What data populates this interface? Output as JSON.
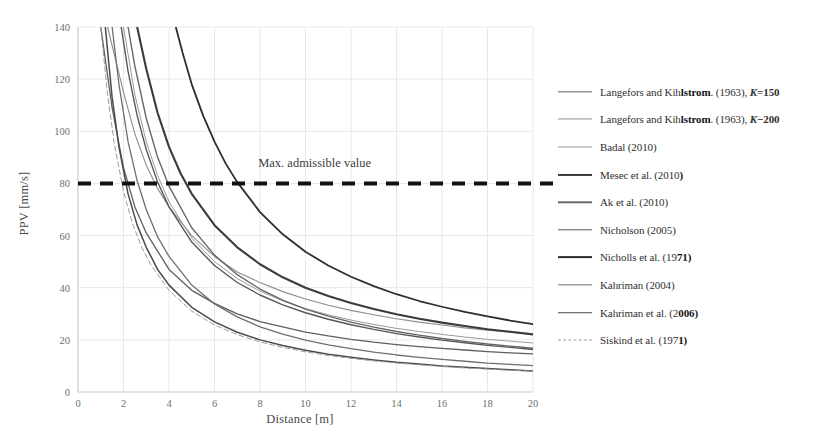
{
  "chart_data": {
    "type": "line",
    "title": "",
    "xlabel": "Distance [m]",
    "ylabel": "PPV [mm/s]",
    "xlim": [
      0,
      20
    ],
    "ylim": [
      0,
      140
    ],
    "xticks": [
      0,
      2,
      4,
      6,
      8,
      10,
      12,
      14,
      16,
      18,
      20
    ],
    "yticks": [
      0,
      20,
      40,
      60,
      80,
      100,
      120,
      140
    ],
    "grid": true,
    "legend_position": "right",
    "annotations": [
      {
        "text": "Max. admissible value",
        "x": 10.4,
        "y": 87,
        "kind": "threshold-label"
      }
    ],
    "threshold": {
      "label": "Max. admissible value",
      "value": 80,
      "style": "dashed",
      "color": "#111111",
      "width": 4
    },
    "series": [
      {
        "name": "Langefors and Kihlstrom. (1963), K=150",
        "color": "#5f5f5f",
        "width": 1.3,
        "dash": "none",
        "x": [
          1.0,
          1.5,
          2.0,
          2.5,
          3.0,
          4.0,
          5.0,
          6.0,
          7.0,
          8.0,
          9.0,
          10.0,
          11.0,
          12.0,
          13.0,
          14.0,
          15.0,
          16.0,
          17.0,
          18.0,
          19.0,
          20.0
        ],
        "y": [
          140.0,
          109.0,
          86.0,
          71.0,
          61.0,
          47.0,
          39.0,
          34.0,
          30.0,
          27.0,
          25.0,
          23.0,
          21.5,
          20.2,
          19.1,
          18.2,
          17.4,
          16.7,
          16.1,
          15.5,
          15.0,
          14.6
        ]
      },
      {
        "name": "Langefors and Kihlstrom. (1963), K=200",
        "color": "#8d8d8d",
        "width": 1.1,
        "dash": "none",
        "x": [
          1.3,
          2.0,
          2.5,
          3.0,
          3.5,
          4.0,
          5.0,
          6.0,
          7.0,
          8.0,
          9.0,
          10.0,
          11.0,
          12.0,
          13.0,
          14.0,
          15.0,
          16.0,
          17.0,
          18.0,
          19.0,
          20.0
        ],
        "y": [
          140.0,
          115.0,
          99.0,
          87.0,
          78.0,
          71.0,
          60.0,
          52.0,
          46.0,
          42.0,
          38.5,
          35.7,
          33.3,
          31.3,
          29.6,
          28.1,
          26.8,
          25.7,
          24.6,
          23.7,
          22.9,
          22.1
        ]
      },
      {
        "name": "Badal (2010)",
        "color": "#9a9a9a",
        "width": 1.0,
        "dash": "none",
        "x": [
          2.0,
          2.5,
          3.0,
          3.5,
          4.0,
          5.0,
          6.0,
          7.0,
          8.0,
          9.0,
          10.0,
          11.0,
          12.0,
          13.0,
          14.0,
          15.0,
          16.0,
          17.0,
          18.0,
          19.0,
          20.0
        ],
        "y": [
          140.0,
          114.0,
          96.0,
          83.0,
          73.0,
          59.0,
          50.0,
          43.5,
          38.7,
          35.0,
          32.0,
          29.6,
          27.6,
          25.9,
          24.4,
          23.2,
          22.1,
          21.1,
          20.2,
          19.5,
          18.8
        ]
      },
      {
        "name": "Mesec et al. (2010)",
        "color": "#3b3b3b",
        "width": 2.1,
        "dash": "none",
        "x": [
          2.6,
          3.0,
          3.5,
          4.0,
          4.5,
          5.0,
          6.0,
          7.0,
          8.0,
          9.0,
          10.0,
          11.0,
          12.0,
          13.0,
          14.0,
          15.0,
          16.0,
          17.0,
          18.0,
          19.0,
          20.0
        ],
        "y": [
          140.0,
          124.0,
          107.0,
          94.0,
          84.0,
          76.0,
          64.0,
          55.5,
          49.0,
          44.0,
          40.0,
          36.8,
          34.1,
          31.8,
          29.8,
          28.1,
          26.6,
          25.3,
          24.1,
          23.1,
          22.1
        ]
      },
      {
        "name": "Ak et al. (2010)",
        "color": "#676767",
        "width": 1.4,
        "dash": "none",
        "x": [
          2.2,
          2.5,
          3.0,
          3.5,
          4.0,
          5.0,
          6.0,
          7.0,
          8.0,
          9.0,
          10.0,
          11.0,
          12.0,
          13.0,
          14.0,
          15.0,
          16.0,
          17.0,
          18.0,
          19.0,
          20.0
        ],
        "y": [
          140.0,
          125.0,
          105.0,
          90.0,
          79.0,
          63.0,
          52.5,
          45.0,
          39.5,
          35.2,
          31.8,
          29.1,
          26.8,
          24.9,
          23.2,
          21.8,
          20.5,
          19.4,
          18.4,
          17.6,
          16.8
        ]
      },
      {
        "name": "Nicholson (2005)",
        "color": "#585858",
        "width": 1.4,
        "dash": "none",
        "x": [
          1.9,
          2.2,
          2.6,
          3.0,
          3.5,
          4.0,
          5.0,
          6.0,
          7.0,
          8.0,
          9.0,
          10.0,
          11.0,
          12.0,
          13.0,
          14.0,
          15.0,
          16.0,
          17.0,
          18.0,
          19.0,
          20.0
        ],
        "y": [
          140.0,
          123.0,
          106.0,
          93.0,
          80.5,
          71.0,
          57.5,
          48.5,
          42.0,
          37.2,
          33.4,
          30.4,
          27.9,
          25.8,
          24.0,
          22.4,
          21.1,
          19.9,
          18.9,
          17.9,
          17.1,
          16.3
        ]
      },
      {
        "name": "Nicholls et al. (1971)",
        "color": "#2e2e2e",
        "width": 1.8,
        "dash": "none",
        "x": [
          4.3,
          4.6,
          5.0,
          5.5,
          6.0,
          6.5,
          7.0,
          8.0,
          9.0,
          10.0,
          11.0,
          12.0,
          13.0,
          14.0,
          15.0,
          16.0,
          17.0,
          18.0,
          19.0,
          20.0
        ],
        "y": [
          140.0,
          130.0,
          118.0,
          106.0,
          96.0,
          87.5,
          80.5,
          69.0,
          60.5,
          53.8,
          48.5,
          44.2,
          40.6,
          37.5,
          34.9,
          32.7,
          30.7,
          29.0,
          27.4,
          26.0
        ]
      },
      {
        "name": "Kahriman (2004)",
        "color": "#6f6f6f",
        "width": 1.3,
        "dash": "none",
        "x": [
          1.5,
          1.8,
          2.2,
          2.6,
          3.0,
          3.5,
          4.0,
          5.0,
          6.0,
          7.0,
          8.0,
          9.0,
          10.0,
          11.0,
          12.0,
          13.0,
          14.0,
          15.0,
          16.0,
          17.0,
          18.0,
          19.0,
          20.0
        ],
        "y": [
          140.0,
          118.0,
          96.0,
          81.0,
          70.0,
          59.5,
          52.0,
          41.0,
          33.8,
          28.8,
          25.0,
          22.2,
          19.9,
          18.1,
          16.6,
          15.3,
          14.2,
          13.3,
          12.5,
          11.8,
          11.1,
          10.6,
          10.1
        ]
      },
      {
        "name": "Kahriman et al. (2006)",
        "color": "#4a4a4a",
        "width": 1.5,
        "dash": "none",
        "x": [
          1.2,
          1.5,
          1.8,
          2.2,
          2.6,
          3.0,
          3.5,
          4.0,
          5.0,
          6.0,
          7.0,
          8.0,
          9.0,
          10.0,
          11.0,
          12.0,
          13.0,
          14.0,
          15.0,
          16.0,
          17.0,
          18.0,
          19.0,
          20.0
        ],
        "y": [
          140.0,
          113.0,
          94.0,
          76.0,
          64.0,
          55.5,
          47.0,
          41.0,
          32.5,
          26.9,
          22.9,
          20.0,
          17.8,
          16.0,
          14.5,
          13.3,
          12.3,
          11.4,
          10.7,
          10.0,
          9.5,
          9.0,
          8.5,
          8.1
        ]
      },
      {
        "name": "Siskind et al. (1971)",
        "color": "#9e9e9e",
        "width": 1.0,
        "dash": "dashed",
        "x": [
          1.0,
          1.3,
          1.6,
          2.0,
          2.4,
          2.8,
          3.2,
          4.0,
          5.0,
          6.0,
          7.0,
          8.0,
          9.0,
          10.0,
          11.0,
          12.0,
          13.0,
          14.0,
          15.0,
          16.0,
          17.0,
          18.0,
          19.0,
          20.0
        ],
        "y": [
          140.0,
          114.0,
          95.0,
          77.0,
          64.5,
          55.5,
          48.8,
          39.0,
          31.0,
          25.7,
          22.0,
          19.2,
          17.1,
          15.4,
          14.0,
          12.9,
          11.9,
          11.1,
          10.4,
          9.8,
          9.2,
          8.8,
          8.3,
          8.0
        ]
      }
    ]
  },
  "legend": {
    "items": [
      {
        "label_pre": "Langefors and Kih",
        "label_smudge": "lstrom",
        "label_post": ". (1963), ",
        "k_sym": "K",
        "k_val": "=150"
      },
      {
        "label_pre": "Langefors and Kih",
        "label_smudge": "lstrom",
        "label_post": ". (1963), ",
        "k_sym": "K",
        "k_val": "−200"
      },
      {
        "label_pre": "Badal (2010)",
        "label_smudge": "",
        "label_post": "",
        "k_sym": "",
        "k_val": ""
      },
      {
        "label_pre": "Mesec et al. (2010",
        "label_smudge": ")",
        "label_post": "",
        "k_sym": "",
        "k_val": ""
      },
      {
        "label_pre": "Ak et al. (2010)",
        "label_smudge": "",
        "label_post": "",
        "k_sym": "",
        "k_val": ""
      },
      {
        "label_pre": "Nicholson (2005)",
        "label_smudge": "",
        "label_post": "",
        "k_sym": "",
        "k_val": ""
      },
      {
        "label_pre": "Nicholls et al. (19",
        "label_smudge": "71)",
        "label_post": "",
        "k_sym": "",
        "k_val": ""
      },
      {
        "label_pre": "Kahriman  (2004)",
        "label_smudge": "",
        "label_post": "",
        "k_sym": "",
        "k_val": ""
      },
      {
        "label_pre": "Kahriman  et al. (2",
        "label_smudge": "006)",
        "label_post": "",
        "k_sym": "",
        "k_val": ""
      },
      {
        "label_pre": "Siskind et al. (197",
        "label_smudge": "1)",
        "label_post": "",
        "k_sym": "",
        "k_val": ""
      }
    ]
  },
  "colors": {
    "background": "#ffffff",
    "grid": "#e8e8e8",
    "axis": "#c8c8c8",
    "tick_text": "#6d6d6d",
    "threshold": "#111111"
  }
}
